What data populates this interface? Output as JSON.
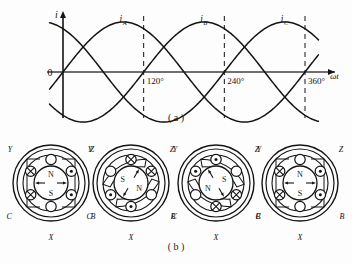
{
  "figure": {
    "caption_a": "( a )",
    "caption_b": "( b )"
  },
  "chart_data": {
    "type": "line",
    "title": "",
    "xlabel": "ωt",
    "ylabel": "i",
    "origin_label": "0",
    "xlim": [
      -20,
      380
    ],
    "ylim": [
      -1.25,
      1.25
    ],
    "grid": false,
    "legend_position": "above-curves",
    "x_tick_labels": [
      "120°",
      "240°",
      "360°"
    ],
    "x_ticks": [
      120,
      240,
      360
    ],
    "dashed_verticals": [
      120,
      240,
      360
    ],
    "series": [
      {
        "name": "i_A",
        "label_main": "i",
        "label_sub": "A",
        "phase_deg": 0,
        "label_x": 90,
        "amplitude": 1,
        "values_deg": [
          -30,
          0,
          30,
          60,
          90,
          120,
          150,
          180,
          210,
          240,
          270,
          300,
          330,
          360,
          380
        ],
        "values": [
          -0.5,
          0,
          0.5,
          0.866,
          1,
          0.866,
          0.5,
          0,
          -0.5,
          -0.866,
          -1,
          -0.866,
          -0.5,
          0,
          0.34
        ]
      },
      {
        "name": "i_B",
        "label_main": "i",
        "label_sub": "B",
        "phase_deg": -120,
        "label_x": 210,
        "amplitude": 1,
        "values_deg": [
          -30,
          0,
          30,
          60,
          90,
          120,
          150,
          180,
          210,
          240,
          270,
          300,
          330,
          360,
          380
        ],
        "values": [
          0.866,
          0.866,
          0.5,
          0,
          -0.5,
          -0.866,
          -1,
          -0.866,
          -0.5,
          0,
          0.5,
          0.866,
          1,
          0.866,
          0.64
        ]
      },
      {
        "name": "i_C",
        "label_main": "i",
        "label_sub": "C",
        "phase_deg": 120,
        "label_x": 330,
        "amplitude": 1,
        "values_deg": [
          -30,
          0,
          30,
          60,
          90,
          120,
          150,
          180,
          210,
          240,
          270,
          300,
          330,
          360,
          380
        ],
        "values": [
          -0.5,
          -0.866,
          -1,
          -0.866,
          -0.5,
          0,
          0.5,
          0.866,
          1,
          0.866,
          0.5,
          0,
          -0.5,
          -0.866,
          -0.98
        ]
      }
    ]
  },
  "rotor_diagrams": [
    {
      "id": "stage-1",
      "time_deg": 0,
      "terminals": {
        "top": "A",
        "top_right": "Z",
        "bottom_right": "B",
        "bottom": "X",
        "bottom_left": "C",
        "top_left": "Y"
      },
      "poles": {
        "north_label": "N",
        "south_label": "S",
        "north_position": "top",
        "south_position": "bottom"
      },
      "field_angle_deg": 90,
      "slots": [
        {
          "terminal": "A",
          "angle_deg": 90,
          "current": "none"
        },
        {
          "terminal": "Z",
          "angle_deg": 30,
          "current": "out"
        },
        {
          "terminal": "B",
          "angle_deg": -30,
          "current": "out"
        },
        {
          "terminal": "X",
          "angle_deg": -90,
          "current": "none"
        },
        {
          "terminal": "C",
          "angle_deg": -150,
          "current": "in"
        },
        {
          "terminal": "Y",
          "angle_deg": 150,
          "current": "in"
        }
      ]
    },
    {
      "id": "stage-2",
      "time_deg": 120,
      "terminals": {
        "top": "A",
        "top_right": "Z",
        "bottom_right": "B",
        "bottom": "X",
        "bottom_left": "C",
        "top_left": "Y"
      },
      "poles": {
        "north_label": "N",
        "south_label": "S",
        "north_position": "lower-right",
        "south_position": "upper-left"
      },
      "field_angle_deg": -30,
      "slots": [
        {
          "terminal": "A",
          "angle_deg": 90,
          "current": "in"
        },
        {
          "terminal": "Z",
          "angle_deg": 30,
          "current": "in"
        },
        {
          "terminal": "B",
          "angle_deg": -30,
          "current": "none"
        },
        {
          "terminal": "X",
          "angle_deg": -90,
          "current": "out"
        },
        {
          "terminal": "C",
          "angle_deg": -150,
          "current": "out"
        },
        {
          "terminal": "Y",
          "angle_deg": 150,
          "current": "none"
        }
      ]
    },
    {
      "id": "stage-3",
      "time_deg": 240,
      "terminals": {
        "top": "A",
        "top_right": "Z",
        "bottom_right": "B",
        "bottom": "X",
        "bottom_left": "C",
        "top_left": "Y"
      },
      "poles": {
        "north_label": "N",
        "south_label": "S",
        "north_position": "lower-left",
        "south_position": "upper-right"
      },
      "field_angle_deg": 210,
      "slots": [
        {
          "terminal": "A",
          "angle_deg": 90,
          "current": "out"
        },
        {
          "terminal": "Z",
          "angle_deg": 30,
          "current": "none"
        },
        {
          "terminal": "B",
          "angle_deg": -30,
          "current": "in"
        },
        {
          "terminal": "X",
          "angle_deg": -90,
          "current": "in"
        },
        {
          "terminal": "C",
          "angle_deg": -150,
          "current": "none"
        },
        {
          "terminal": "Y",
          "angle_deg": 150,
          "current": "out"
        }
      ]
    },
    {
      "id": "stage-4",
      "time_deg": 360,
      "terminals": {
        "top": "A",
        "top_right": "Z",
        "bottom_right": "B",
        "bottom": "X",
        "bottom_left": "C",
        "top_left": "Y"
      },
      "poles": {
        "north_label": "N",
        "south_label": "S",
        "north_position": "top",
        "south_position": "bottom"
      },
      "field_angle_deg": 90,
      "slots": [
        {
          "terminal": "A",
          "angle_deg": 90,
          "current": "none"
        },
        {
          "terminal": "Z",
          "angle_deg": 30,
          "current": "out"
        },
        {
          "terminal": "B",
          "angle_deg": -30,
          "current": "out"
        },
        {
          "terminal": "X",
          "angle_deg": -90,
          "current": "none"
        },
        {
          "terminal": "C",
          "angle_deg": -150,
          "current": "in"
        },
        {
          "terminal": "Y",
          "angle_deg": 150,
          "current": "in"
        }
      ]
    }
  ],
  "colors": {
    "ink": "#141414",
    "axis": "#6f6f6f",
    "background": "#fdfdfd"
  }
}
